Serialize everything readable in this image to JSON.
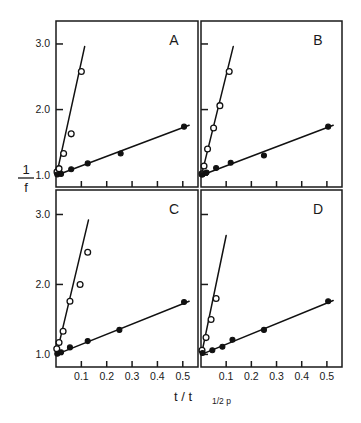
{
  "figure": {
    "y_axis_title_numerator": "1",
    "y_axis_title_denominator": "f",
    "x_axis_title_main": "t / t",
    "x_axis_title_subscript": "1/2 p",
    "background_color": "#ffffff",
    "ink_color": "#111111"
  },
  "axes": {
    "x_ticks": [
      "0.1",
      "0.2",
      "0.3",
      "0.4",
      "0.5"
    ],
    "x_tick_values": [
      0.1,
      0.2,
      0.3,
      0.4,
      0.5
    ],
    "y_ticks": [
      "1.0",
      "2.0",
      "3.0"
    ],
    "y_tick_values": [
      1.0,
      2.0,
      3.0
    ],
    "xlim": [
      0.0,
      0.56
    ],
    "ylim": [
      0.82,
      3.35
    ],
    "grid": false
  },
  "chart_data": [
    {
      "type": "scatter",
      "panel": "A",
      "title": "A",
      "xlabel": "t / t 1/2 p",
      "ylabel": "1/f",
      "xlim": [
        0.0,
        0.56
      ],
      "ylim": [
        0.82,
        3.35
      ],
      "grid": false,
      "legend": "none",
      "series": [
        {
          "name": "open-circles",
          "marker": "open-circle",
          "x": [
            0.004,
            0.012,
            0.03,
            0.06,
            0.1
          ],
          "y": [
            1.05,
            1.1,
            1.33,
            1.63,
            2.58
          ],
          "fit_line": {
            "x": [
              0.002,
              0.113
            ],
            "y": [
              1.0,
              2.96
            ]
          }
        },
        {
          "name": "filled-circles",
          "marker": "filled-circle",
          "x": [
            0.005,
            0.02,
            0.06,
            0.125,
            0.255,
            0.505
          ],
          "y": [
            1.01,
            1.02,
            1.09,
            1.18,
            1.33,
            1.74
          ],
          "fit_line": {
            "x": [
              0.002,
              0.525
            ],
            "y": [
              1.0,
              1.76
            ]
          }
        }
      ]
    },
    {
      "type": "scatter",
      "panel": "B",
      "title": "B",
      "xlabel": "t / t 1/2 p",
      "ylabel": "1/f",
      "xlim": [
        0.0,
        0.56
      ],
      "ylim": [
        0.82,
        3.35
      ],
      "grid": false,
      "legend": "none",
      "series": [
        {
          "name": "open-circles",
          "marker": "open-circle",
          "x": [
            0.004,
            0.012,
            0.026,
            0.05,
            0.075,
            0.112
          ],
          "y": [
            1.02,
            1.14,
            1.4,
            1.72,
            2.06,
            2.58
          ],
          "fit_line": {
            "x": [
              0.002,
              0.128
            ],
            "y": [
              1.0,
              2.96
            ]
          }
        },
        {
          "name": "filled-circles",
          "marker": "filled-circle",
          "x": [
            0.005,
            0.022,
            0.06,
            0.118,
            0.25,
            0.505
          ],
          "y": [
            1.01,
            1.04,
            1.11,
            1.19,
            1.3,
            1.74
          ],
          "fit_line": {
            "x": [
              0.002,
              0.525
            ],
            "y": [
              1.0,
              1.76
            ]
          }
        }
      ]
    },
    {
      "type": "scatter",
      "panel": "C",
      "title": "C",
      "xlabel": "t / t 1/2 p",
      "ylabel": "1/f",
      "xlim": [
        0.0,
        0.56
      ],
      "ylim": [
        0.82,
        3.35
      ],
      "grid": false,
      "legend": "none",
      "series": [
        {
          "name": "open-circles",
          "marker": "open-circle",
          "x": [
            0.003,
            0.012,
            0.028,
            0.055,
            0.095,
            0.125
          ],
          "y": [
            1.08,
            1.17,
            1.33,
            1.76,
            2.0,
            2.46
          ],
          "fit_line": {
            "x": [
              0.002,
              0.128
            ],
            "y": [
              1.0,
              2.92
            ]
          }
        },
        {
          "name": "filled-circles",
          "marker": "filled-circle",
          "x": [
            0.005,
            0.02,
            0.055,
            0.125,
            0.25,
            0.505
          ],
          "y": [
            1.01,
            1.03,
            1.1,
            1.19,
            1.35,
            1.75
          ],
          "fit_line": {
            "x": [
              0.002,
              0.525
            ],
            "y": [
              1.0,
              1.76
            ]
          }
        }
      ]
    },
    {
      "type": "scatter",
      "panel": "D",
      "title": "D",
      "xlabel": "t / t 1/2 p",
      "ylabel": "1/f",
      "xlim": [
        0.0,
        0.56
      ],
      "ylim": [
        0.82,
        3.35
      ],
      "grid": false,
      "legend": "none",
      "series": [
        {
          "name": "open-circles",
          "marker": "open-circle",
          "x": [
            0.004,
            0.02,
            0.04,
            0.06
          ],
          "y": [
            1.06,
            1.24,
            1.5,
            1.8
          ],
          "fit_line": {
            "x": [
              0.002,
              0.1
            ],
            "y": [
              1.0,
              2.7
            ]
          }
        },
        {
          "name": "filled-circles",
          "marker": "filled-circle",
          "x": [
            0.006,
            0.045,
            0.085,
            0.125,
            0.25,
            0.505
          ],
          "y": [
            1.02,
            1.06,
            1.11,
            1.21,
            1.35,
            1.76
          ],
          "fit_line": {
            "x": [
              0.002,
              0.525
            ],
            "y": [
              1.0,
              1.77
            ]
          }
        }
      ]
    }
  ]
}
